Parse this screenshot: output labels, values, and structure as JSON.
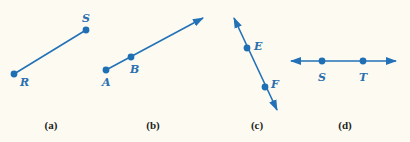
{
  "colors": {
    "line": "#2372b8",
    "point": "#1f6fb5",
    "label": "#2a6fb0",
    "caption": "#222222",
    "background": "#fdfbf1"
  },
  "figures": [
    {
      "caption": "(a)",
      "type": "segment",
      "points": [
        {
          "label": "R"
        },
        {
          "label": "S"
        }
      ]
    },
    {
      "caption": "(b)",
      "type": "ray",
      "points": [
        {
          "label": "A"
        },
        {
          "label": "B"
        }
      ]
    },
    {
      "caption": "(c)",
      "type": "line",
      "points": [
        {
          "label": "E"
        },
        {
          "label": "F"
        }
      ]
    },
    {
      "caption": "(d)",
      "type": "line",
      "points": [
        {
          "label": "S"
        },
        {
          "label": "T"
        }
      ]
    }
  ]
}
